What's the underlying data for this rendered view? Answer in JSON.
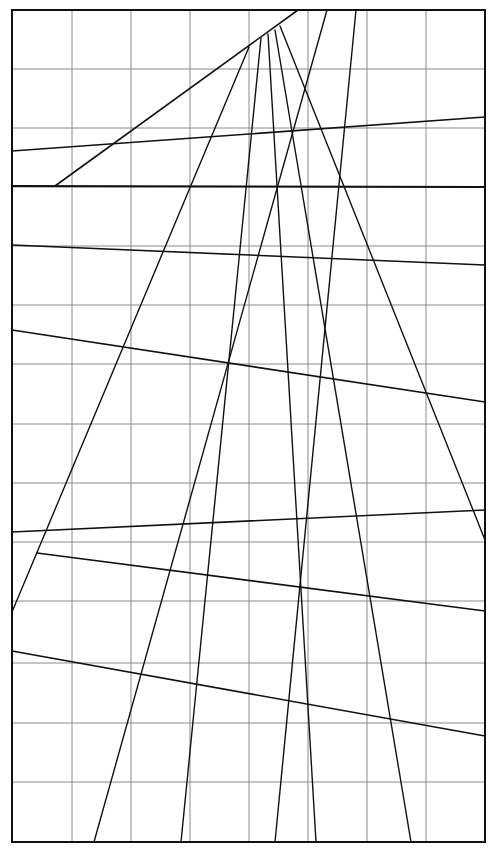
{
  "diagram": {
    "title": "",
    "frame": {
      "x1": 12,
      "y1": 10,
      "x2": 485,
      "y2": 842
    },
    "grid": {
      "verticals": [
        12,
        72,
        131,
        190,
        249,
        308,
        367,
        426,
        485
      ],
      "horizontals": [
        10,
        69,
        128,
        187,
        246,
        305,
        364,
        424,
        483,
        542,
        601,
        663,
        723,
        782,
        842
      ]
    },
    "colors": {
      "background": "#ffffff",
      "grid": "#8a8a8a",
      "ink": "#111111"
    },
    "lines": [
      {
        "x1": 55,
        "y1": 186,
        "x2": 298,
        "y2": 10,
        "w": 1.6
      },
      {
        "x1": 12,
        "y1": 151,
        "x2": 485,
        "y2": 117,
        "w": 1.6
      },
      {
        "x1": 12,
        "y1": 186,
        "x2": 485,
        "y2": 187,
        "w": 2.0
      },
      {
        "x1": 12,
        "y1": 245,
        "x2": 485,
        "y2": 265,
        "w": 1.6
      },
      {
        "x1": 12,
        "y1": 330,
        "x2": 485,
        "y2": 402,
        "w": 1.6
      },
      {
        "x1": 12,
        "y1": 532,
        "x2": 485,
        "y2": 510,
        "w": 1.6
      },
      {
        "x1": 37,
        "y1": 553,
        "x2": 485,
        "y2": 611,
        "w": 1.6
      },
      {
        "x1": 12,
        "y1": 651,
        "x2": 485,
        "y2": 736,
        "w": 1.6
      },
      {
        "x1": 12,
        "y1": 612,
        "x2": 249,
        "y2": 47,
        "w": 1.4
      },
      {
        "x1": 94,
        "y1": 842,
        "x2": 327,
        "y2": 10,
        "w": 1.4
      },
      {
        "x1": 181,
        "y1": 842,
        "x2": 261,
        "y2": 38,
        "w": 1.4
      },
      {
        "x1": 275,
        "y1": 842,
        "x2": 356,
        "y2": 10,
        "w": 1.4
      },
      {
        "x1": 316,
        "y1": 842,
        "x2": 268,
        "y2": 34,
        "w": 1.4
      },
      {
        "x1": 411,
        "y1": 842,
        "x2": 275,
        "y2": 30,
        "w": 1.4
      },
      {
        "x1": 485,
        "y1": 540,
        "x2": 280,
        "y2": 26,
        "w": 1.4
      }
    ]
  }
}
